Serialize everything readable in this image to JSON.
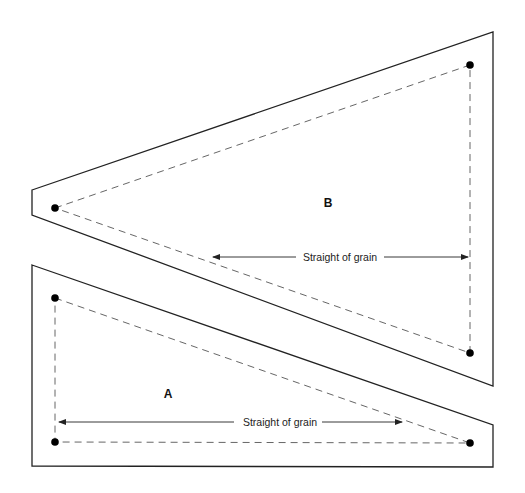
{
  "diagram": {
    "type": "sewing-pattern",
    "pieces": [
      {
        "id": "B",
        "label": "B",
        "grain_label": "Straight of grain",
        "outline": [
          [
            32,
            190
          ],
          [
            493,
            32
          ],
          [
            493,
            386
          ],
          [
            32,
            215
          ]
        ],
        "seam_points": [
          [
            55,
            208
          ],
          [
            470,
            65
          ],
          [
            470,
            353
          ]
        ],
        "grain_arrow": {
          "x1": 213,
          "x2": 468,
          "y": 257,
          "text_x": 340
        },
        "label_pos": [
          328,
          207
        ]
      },
      {
        "id": "A",
        "label": "A",
        "grain_label": "Straight of grain",
        "outline": [
          [
            32,
            265
          ],
          [
            493,
            425
          ],
          [
            493,
            467
          ],
          [
            32,
            466
          ]
        ],
        "seam_points": [
          [
            55,
            298
          ],
          [
            470,
            443
          ],
          [
            55,
            442
          ]
        ],
        "grain_arrow": {
          "x1": 59,
          "x2": 402,
          "y": 422,
          "text_x": 280
        },
        "label_pos": [
          168,
          398
        ]
      }
    ],
    "colors": {
      "outline": "#222222",
      "seam": "#555555",
      "dot": "#000000",
      "background": "#ffffff"
    }
  }
}
